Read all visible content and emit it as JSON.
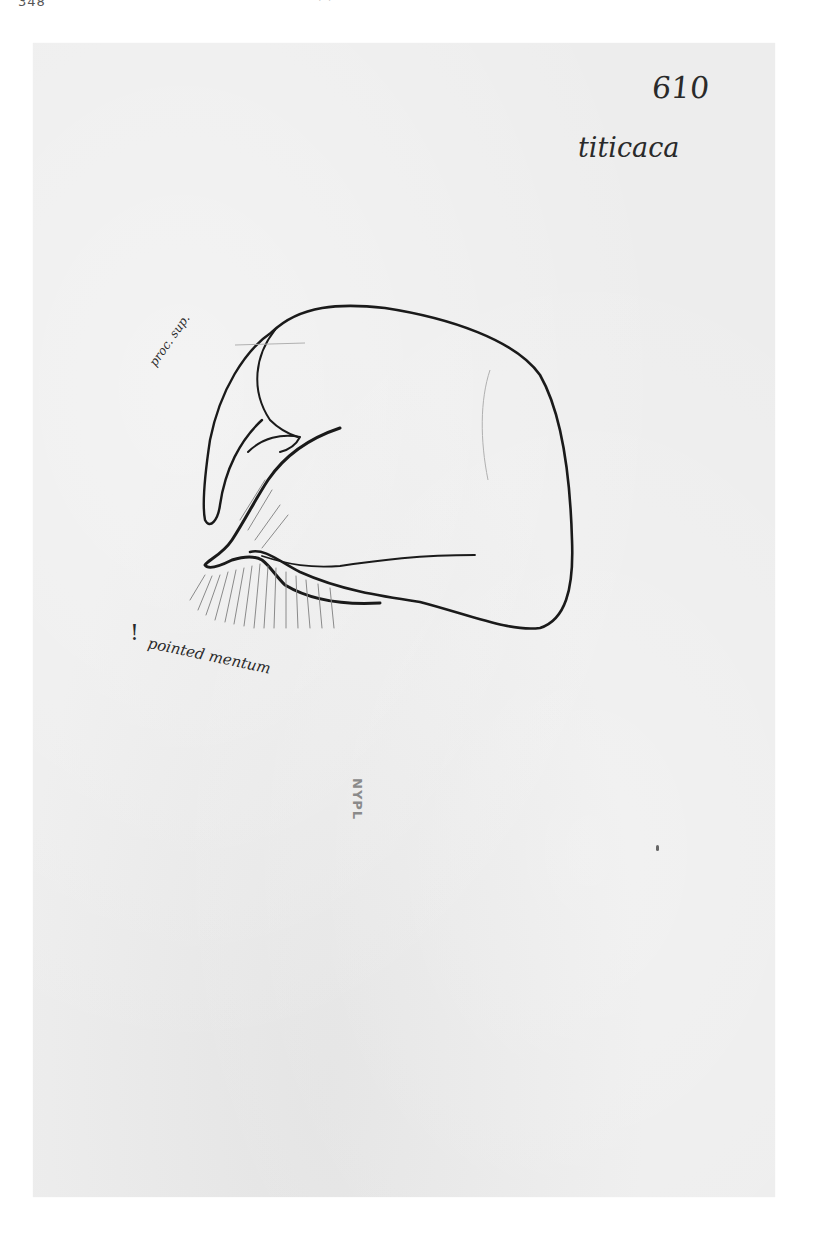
{
  "header": {
    "page_number_partial": "348",
    "right_partial": "' '"
  },
  "card": {
    "background_color": "#ededed",
    "specimen_number": "610",
    "species_name": "titicaca",
    "annotations": {
      "process_label": "proc. sup.",
      "exclamation": "!",
      "pointed_label": "pointed mentum"
    },
    "stamp": "NYPL",
    "drawing": {
      "subject": "insect genitalia, lateral view",
      "ink_color": "#1a1a1a",
      "pencil_color": "#9a9a9a"
    }
  }
}
